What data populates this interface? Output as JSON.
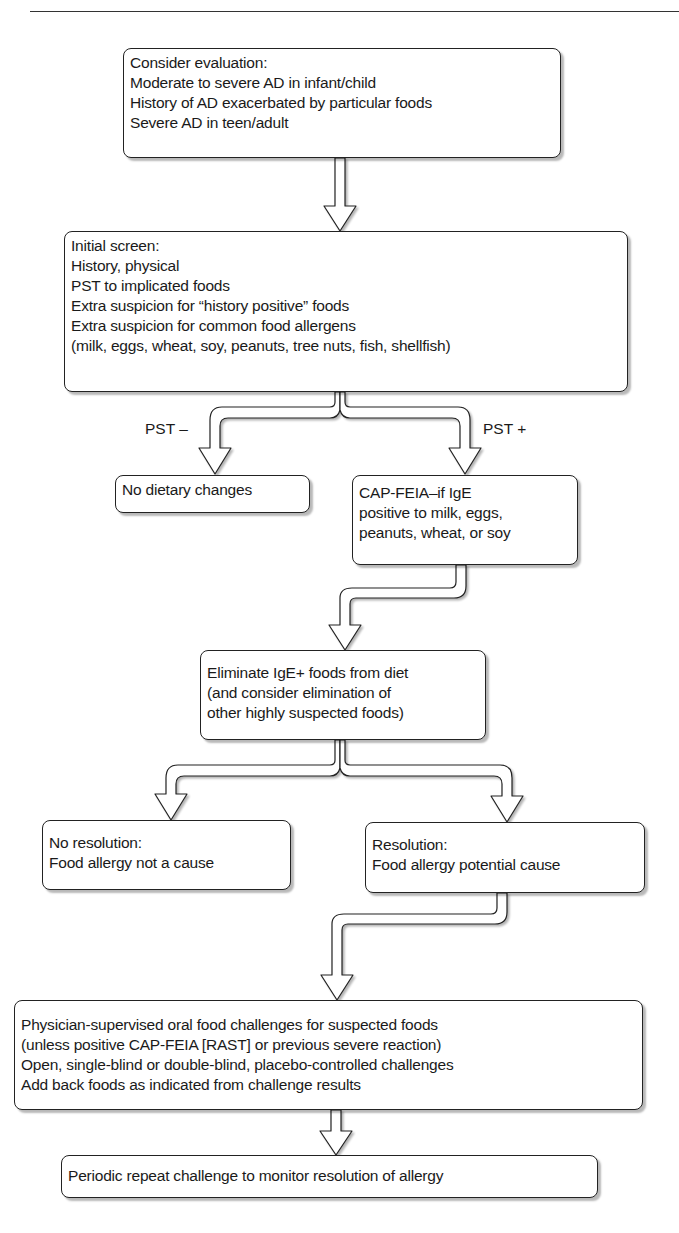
{
  "flowchart": {
    "nodes": {
      "consider": {
        "lines": [
          "Consider evaluation:",
          "Moderate to severe AD in infant/child",
          "History of AD exacerbated by particular foods",
          "Severe AD in teen/adult"
        ]
      },
      "initial_screen": {
        "lines": [
          "Initial screen:",
          "History, physical",
          "PST to implicated foods",
          "Extra suspicion for “history positive” foods",
          "Extra suspicion for common food allergens",
          "(milk, eggs, wheat, soy, peanuts, tree nuts, fish, shellfish)"
        ]
      },
      "no_dietary": {
        "lines": [
          "No dietary changes"
        ]
      },
      "cap_feia": {
        "lines": [
          "CAP-FEIA–if IgE",
          "positive to milk, eggs,",
          "peanuts, wheat, or soy"
        ]
      },
      "eliminate": {
        "lines": [
          "Eliminate IgE+ foods from diet",
          "(and consider elimination of",
          "other highly suspected foods)"
        ]
      },
      "no_resolution": {
        "lines": [
          "No resolution:",
          "Food allergy not a cause"
        ]
      },
      "resolution": {
        "lines": [
          "Resolution:",
          "Food allergy potential cause"
        ]
      },
      "challenges": {
        "lines": [
          "Physician-supervised oral food challenges for suspected foods",
          "(unless positive CAP-FEIA [RAST] or previous severe reaction)",
          "Open, single-blind or double-blind, placebo-controlled challenges",
          "Add back foods as indicated from challenge results"
        ]
      },
      "periodic": {
        "lines": [
          "Periodic repeat challenge to monitor resolution of allergy"
        ]
      }
    },
    "edge_labels": {
      "pst_negative": "PST –",
      "pst_positive": "PST +"
    },
    "edges": [
      {
        "from": "consider",
        "to": "initial_screen"
      },
      {
        "from": "initial_screen",
        "to": "no_dietary",
        "label": "PST –"
      },
      {
        "from": "initial_screen",
        "to": "cap_feia",
        "label": "PST +"
      },
      {
        "from": "cap_feia",
        "to": "eliminate"
      },
      {
        "from": "eliminate",
        "to": "no_resolution"
      },
      {
        "from": "eliminate",
        "to": "resolution"
      },
      {
        "from": "resolution",
        "to": "challenges"
      },
      {
        "from": "challenges",
        "to": "periodic"
      }
    ]
  }
}
